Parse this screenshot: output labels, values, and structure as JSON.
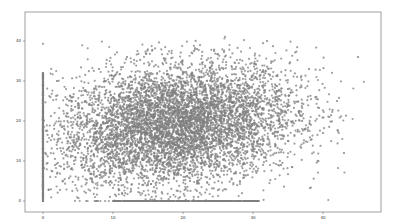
{
  "chart_data": {
    "type": "scatter",
    "title": "",
    "xlabel": "",
    "ylabel": "",
    "xlim": [
      -4,
      47
    ],
    "ylim": [
      -1,
      43
    ],
    "grid": false,
    "legend": null,
    "x_ticks": [
      0,
      10,
      20,
      30,
      40
    ],
    "y_ticks": [
      0,
      10,
      20,
      30,
      40
    ],
    "point_color": "#7f7f7f",
    "point_count_estimate": 20000,
    "series": [
      {
        "name": "points",
        "description": "Dense elliptical cloud centered near (20, 20); a vertical band of points at x=0 spanning y≈0-32; a dense horizontal band at y≈0 spanning x≈10-31; sparse outliers up to x≈45 and y≈41",
        "x": [
          0,
          0,
          0,
          0,
          0,
          2,
          4,
          5,
          8,
          10,
          12,
          14,
          15,
          18,
          20,
          22,
          24,
          25,
          27,
          28,
          30,
          32,
          34,
          35,
          37,
          38,
          40,
          42,
          43,
          45,
          15,
          20,
          25,
          18,
          22,
          10,
          30,
          5,
          35,
          12,
          28,
          20,
          24,
          16,
          26,
          19,
          21
        ],
        "y": [
          2,
          10,
          18,
          25,
          31,
          30,
          8,
          21,
          33,
          14,
          36,
          27,
          4,
          22,
          19,
          38,
          11,
          0,
          30,
          16,
          24,
          40,
          9,
          28,
          20,
          33,
          17,
          25,
          12,
          36,
          0,
          0,
          0,
          24,
          20,
          26,
          13,
          12,
          15,
          20,
          29,
          10,
          32,
          17,
          22,
          27,
          5
        ]
      }
    ]
  },
  "axes": {
    "x_tick_labels": [
      "0",
      "10",
      "20",
      "30",
      "40"
    ],
    "y_tick_labels": [
      "0",
      "10",
      "20",
      "30",
      "40"
    ]
  }
}
